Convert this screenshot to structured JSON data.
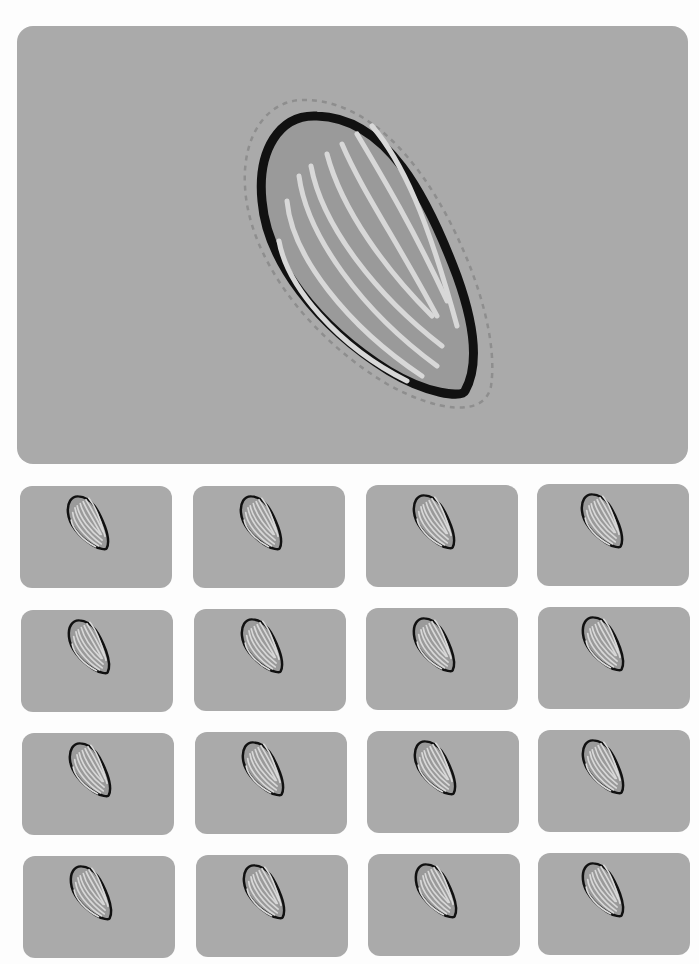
{
  "colors": {
    "background": "#fdfdfd",
    "card": "#aaaaaa",
    "seed_fill": "#9a9a9a",
    "seed_outline": "#111111",
    "seed_stripe": "#d8d8d8",
    "cut_line": "#8e8e8e"
  },
  "main_sticker": {
    "icon": "sunflower-seed-icon",
    "has_dashed_cut_line": true
  },
  "grid": {
    "rows": 4,
    "columns": 4,
    "icon": "sunflower-seed-icon",
    "stickers": [
      {
        "row": 1,
        "col": 1
      },
      {
        "row": 1,
        "col": 2
      },
      {
        "row": 1,
        "col": 3
      },
      {
        "row": 1,
        "col": 4
      },
      {
        "row": 2,
        "col": 1
      },
      {
        "row": 2,
        "col": 2
      },
      {
        "row": 2,
        "col": 3
      },
      {
        "row": 2,
        "col": 4
      },
      {
        "row": 3,
        "col": 1
      },
      {
        "row": 3,
        "col": 2
      },
      {
        "row": 3,
        "col": 3
      },
      {
        "row": 3,
        "col": 4
      },
      {
        "row": 4,
        "col": 1
      },
      {
        "row": 4,
        "col": 2
      },
      {
        "row": 4,
        "col": 3
      },
      {
        "row": 4,
        "col": 4
      }
    ]
  }
}
